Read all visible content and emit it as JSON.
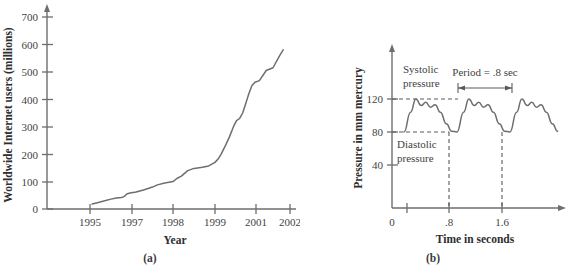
{
  "figure": {
    "panel_a_label": "(a)",
    "panel_b_label": "(b)"
  },
  "chart_data": [
    {
      "id": "internet-users",
      "type": "line",
      "title": "",
      "xlabel": "Year",
      "ylabel": "Worldwide Internet users (millions)",
      "xlim": [
        1994.5,
        2002.0
      ],
      "ylim": [
        0,
        740
      ],
      "grid": false,
      "legend": "none",
      "ytick_labels": [
        "0",
        "100",
        "200",
        "300",
        "400",
        "500",
        "600",
        "700"
      ],
      "ytick_values": [
        0,
        100,
        200,
        300,
        400,
        500,
        600,
        700
      ],
      "xtick_labels": [
        "1995",
        "1997",
        "1998",
        "1999",
        "2001",
        "2002"
      ],
      "xtick_values": [
        1995,
        1997,
        1998,
        1999,
        2001,
        2002
      ],
      "x": [
        1995.1,
        1995.4,
        1995.7,
        1996.0,
        1996.25,
        1996.5,
        1996.62,
        1996.75,
        1996.9,
        1997.1,
        1997.3,
        1997.5,
        1997.62,
        1997.8,
        1998.0,
        1998.1,
        1998.2,
        1998.35,
        1998.5,
        1998.7,
        1998.85,
        1999.0,
        1999.15,
        1999.3,
        1999.5,
        1999.7,
        1999.9,
        2000.05,
        2000.2,
        2000.35,
        2000.5,
        2000.65,
        2000.8,
        2000.95,
        2001.1,
        2001.3,
        2001.5,
        2001.7,
        2001.8
      ],
      "y": [
        18,
        24,
        30,
        36,
        40,
        42,
        45,
        55,
        58,
        62,
        70,
        80,
        88,
        95,
        100,
        112,
        120,
        140,
        148,
        152,
        157,
        170,
        182,
        200,
        230,
        262,
        300,
        322,
        330,
        350,
        385,
        420,
        450,
        462,
        468,
        505,
        515,
        560,
        580
      ],
      "series_note": "Step-like growth curve of worldwide Internet users"
    },
    {
      "id": "blood-pressure",
      "type": "line",
      "title": "",
      "xlabel": "Time in seconds",
      "ylabel": "Pressure in mm mercury",
      "xlim": [
        0,
        2.6
      ],
      "ylim": [
        0,
        150
      ],
      "grid": false,
      "legend": "none",
      "ytick_labels": [
        "40",
        "80",
        "120"
      ],
      "ytick_values": [
        40,
        80,
        120
      ],
      "xtick_labels": [
        "0",
        ".8",
        "1.6"
      ],
      "xtick_values": [
        0,
        0.8,
        1.6
      ],
      "systolic": 120,
      "diastolic": 80,
      "period": 0.8,
      "annotations": [
        {
          "name": "systolic-label",
          "text": "Systolic\npressure",
          "line1": "Systolic",
          "line2": "pressure"
        },
        {
          "name": "diastolic-label",
          "text": "Diastolic\npressure",
          "line1": "Diastolic",
          "line2": "pressure"
        },
        {
          "name": "period-label",
          "text": "Period = .8 sec"
        }
      ],
      "waveform_cycle": {
        "t_offsets": [
          0.0,
          0.1,
          0.18,
          0.26,
          0.33,
          0.4,
          0.47,
          0.55,
          0.64,
          0.72,
          0.8
        ],
        "values": [
          80,
          104,
          120,
          112,
          116,
          110,
          113,
          104,
          90,
          81,
          80
        ]
      },
      "cycles_start": 0.12,
      "n_cycles": 3
    }
  ]
}
